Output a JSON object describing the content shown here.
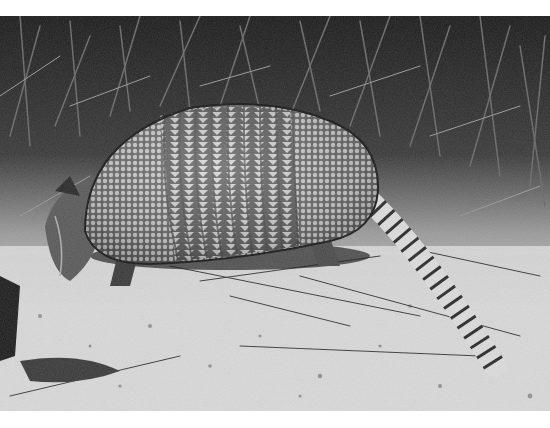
{
  "image": {
    "subject": "Nine-banded armadillo",
    "description": "Black-and-white photograph of an armadillo walking among grass on sandy ground",
    "style": "grayscale",
    "frame": {
      "top_margin_px": 16,
      "bottom_margin_px": 17,
      "background": "#ffffff"
    },
    "colors": {
      "grass_dark": "#1e1e1e",
      "grass_mid": "#5a5a5a",
      "sand": "#d8d8d8",
      "shell_light": "#e6e6e6",
      "shell_dark": "#2a2a2a"
    }
  }
}
